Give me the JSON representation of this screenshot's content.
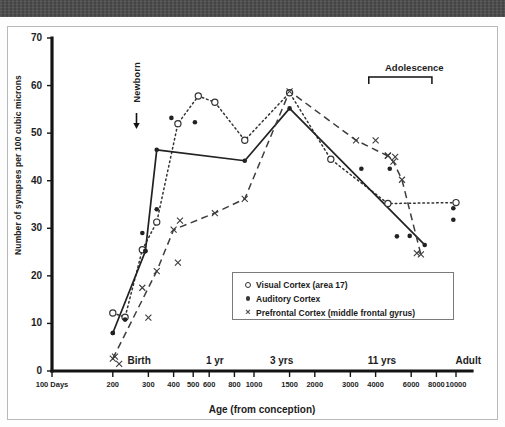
{
  "figure": {
    "background_color": "#ffffff",
    "band_color": "#4c4c4c",
    "frame_color": "#b9b9b9"
  },
  "annotations": {
    "newborn": "Newborn",
    "adolescence": "Adolescence"
  },
  "legend": {
    "entries": [
      {
        "symbol": "open-circle",
        "label": "Visual Cortex (area 17)"
      },
      {
        "symbol": "filled-circle",
        "label": "Auditory Cortex"
      },
      {
        "symbol": "cross",
        "label": "Prefrontal Cortex (middle frontal gyrus)"
      }
    ]
  },
  "chart_data": {
    "type": "line",
    "title": "",
    "xlabel": "Age (from conception)",
    "ylabel": "Number of synapses per 100 cubic microns",
    "x_scale": "log",
    "xlim": [
      100,
      12000
    ],
    "ylim": [
      0,
      70
    ],
    "y_ticks": [
      0,
      10,
      20,
      30,
      40,
      50,
      60,
      70
    ],
    "x_ticks": [
      100,
      200,
      300,
      400,
      500,
      600,
      800,
      1000,
      1500,
      2000,
      3000,
      4000,
      6000,
      8000,
      10000
    ],
    "x_tick_labels": [
      "100 Days",
      "200",
      "300",
      "400",
      "500",
      "600",
      "800",
      "1000",
      "1500",
      "2000",
      "3000",
      "4000",
      "6000",
      "8000",
      "10000"
    ],
    "x_stage_labels": [
      {
        "at": 270,
        "text": "Birth"
      },
      {
        "at": 640,
        "text": "1 yr"
      },
      {
        "at": 1370,
        "text": "3 yrs"
      },
      {
        "at": 4300,
        "text": "11 yrs"
      },
      {
        "at": 11500,
        "text": "Adult"
      }
    ],
    "grid": false,
    "legend_position": "inside-lower-right",
    "series": [
      {
        "name": "Visual Cortex (area 17)",
        "marker": "open-circle",
        "line_style": "dotted",
        "color": "#333333",
        "points": [
          {
            "x": 200,
            "y": 12.2
          },
          {
            "x": 230,
            "y": 11.3
          },
          {
            "x": 280,
            "y": 25.5
          },
          {
            "x": 330,
            "y": 31.3
          },
          {
            "x": 420,
            "y": 52.0
          },
          {
            "x": 530,
            "y": 57.8
          },
          {
            "x": 640,
            "y": 56.5
          },
          {
            "x": 900,
            "y": 48.5
          },
          {
            "x": 1500,
            "y": 58.5
          },
          {
            "x": 2400,
            "y": 44.5
          },
          {
            "x": 4600,
            "y": 35.2
          },
          {
            "x": 10000,
            "y": 35.4
          }
        ]
      },
      {
        "name": "Auditory Cortex",
        "marker": "filled-circle",
        "line_style": "solid",
        "color": "#222222",
        "points": [
          {
            "x": 200,
            "y": 8.0
          },
          {
            "x": 290,
            "y": 25.2
          },
          {
            "x": 330,
            "y": 46.5
          },
          {
            "x": 900,
            "y": 44.2
          },
          {
            "x": 1500,
            "y": 55.2
          },
          {
            "x": 7000,
            "y": 26.5
          }
        ],
        "scatter_points": [
          {
            "x": 200,
            "y": 8.0
          },
          {
            "x": 230,
            "y": 10.8
          },
          {
            "x": 280,
            "y": 29.0
          },
          {
            "x": 290,
            "y": 25.2
          },
          {
            "x": 330,
            "y": 34.0
          },
          {
            "x": 390,
            "y": 53.2
          },
          {
            "x": 510,
            "y": 52.3
          },
          {
            "x": 3400,
            "y": 42.5
          },
          {
            "x": 4700,
            "y": 42.5
          },
          {
            "x": 5100,
            "y": 28.3
          },
          {
            "x": 5900,
            "y": 28.4
          },
          {
            "x": 9700,
            "y": 34.2
          },
          {
            "x": 9700,
            "y": 31.8
          }
        ]
      },
      {
        "name": "Prefrontal Cortex (middle frontal gyrus)",
        "marker": "cross",
        "line_style": "dashed",
        "color": "#3d3d3d",
        "points": [
          {
            "x": 200,
            "y": 2.6
          },
          {
            "x": 330,
            "y": 21.0
          },
          {
            "x": 400,
            "y": 29.7
          },
          {
            "x": 640,
            "y": 33.2
          },
          {
            "x": 900,
            "y": 36.2
          },
          {
            "x": 1500,
            "y": 58.8
          },
          {
            "x": 3200,
            "y": 48.5
          },
          {
            "x": 4600,
            "y": 45.2
          },
          {
            "x": 4900,
            "y": 44.0
          },
          {
            "x": 5400,
            "y": 40.2
          },
          {
            "x": 6700,
            "y": 24.5
          }
        ],
        "scatter_points": [
          {
            "x": 205,
            "y": 3.0
          },
          {
            "x": 215,
            "y": 1.5
          },
          {
            "x": 280,
            "y": 17.5
          },
          {
            "x": 300,
            "y": 11.2
          },
          {
            "x": 420,
            "y": 22.8
          },
          {
            "x": 430,
            "y": 31.6
          },
          {
            "x": 4000,
            "y": 48.5
          },
          {
            "x": 4600,
            "y": 45.3
          },
          {
            "x": 5000,
            "y": 45.0
          },
          {
            "x": 6400,
            "y": 24.8
          }
        ]
      }
    ]
  }
}
